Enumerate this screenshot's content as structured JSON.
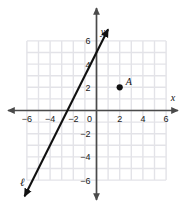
{
  "chart_data": {
    "type": "scatter",
    "title": "",
    "xlabel": "x",
    "ylabel": "y",
    "xlim": [
      -6.8,
      6.8
    ],
    "ylim": [
      -6.8,
      6.8
    ],
    "grid": true,
    "grid_step": 1,
    "legend": "none",
    "x_ticks": [
      -6,
      -4,
      -2,
      0,
      2,
      4,
      6
    ],
    "x_tick_labels": [
      "-6",
      "-4",
      "-2",
      "0",
      "2",
      "4",
      "6"
    ],
    "y_ticks": [
      -6,
      -4,
      -2,
      2,
      4,
      6
    ],
    "y_tick_labels": [
      "-6",
      "-4",
      "-2",
      "2",
      "4",
      "6"
    ],
    "origin_label": "0",
    "points": [
      {
        "name": "A",
        "label": "A",
        "x": 2,
        "y": 2,
        "marker": "filled-circle",
        "color": "#111111"
      }
    ],
    "lines": [
      {
        "name": "l",
        "label": "ℓ",
        "slope": 2,
        "y_intercept": 5,
        "x_intercept": -2.5,
        "from": {
          "x": -6.2,
          "y": -7.4
        },
        "to": {
          "x": 1.0,
          "y": 7.0
        },
        "arrow_start": true,
        "arrow_end": true,
        "color": "#111111",
        "label_position": {
          "x": -6.4,
          "y": -6.5
        }
      }
    ],
    "axis_arrows": {
      "x_left": true,
      "x_right": true,
      "y_top": true,
      "y_bottom": true
    },
    "colors": {
      "grid": "#e3e3e8",
      "axis": "#4a4a4a",
      "line": "#111111",
      "point": "#111111",
      "background": "#ffffff"
    }
  }
}
